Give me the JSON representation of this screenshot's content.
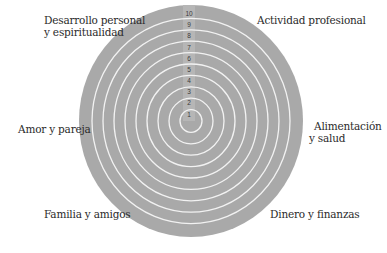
{
  "diagram": {
    "type": "wheel-of-life",
    "colors": {
      "disc": "#a9a9a9",
      "rings": "#f2f2f2",
      "axis_strip": "#b8b8b8",
      "text": "#2b2b2b"
    },
    "scale": [
      "1",
      "2",
      "3",
      "4",
      "5",
      "6",
      "7",
      "8",
      "9",
      "10"
    ],
    "areas": [
      {
        "id": "desarrollo",
        "line1": "Desarrollo personal",
        "line2": "y espiritualidad"
      },
      {
        "id": "actividad",
        "line1": "Actividad profesional",
        "line2": ""
      },
      {
        "id": "alimentacion",
        "line1": "Alimentación",
        "line2": "y salud"
      },
      {
        "id": "dinero",
        "line1": "Dinero y finanzas",
        "line2": ""
      },
      {
        "id": "familia",
        "line1": "Familia y amigos",
        "line2": ""
      },
      {
        "id": "amor",
        "line1": "Amor y pareja",
        "line2": ""
      }
    ]
  }
}
